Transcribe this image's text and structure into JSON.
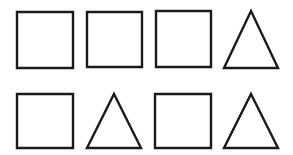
{
  "canvas": {
    "width": 293,
    "height": 155,
    "background_color": "#ffffff",
    "description": "Grid of outlined geometric shapes"
  },
  "style": {
    "stroke_color": "#1a1a1a",
    "fill_color": "none",
    "stroke_width": 2.4
  },
  "grid": {
    "rows": 2,
    "columns": 4,
    "total_shapes": 8
  },
  "shapes": [
    {
      "id": "shape-r1c1",
      "type": "square",
      "row": 1,
      "column": 1,
      "x": 17,
      "y": 12,
      "width": 56,
      "height": 56,
      "points": "17,12 73,12 73,68 17,68"
    },
    {
      "id": "shape-r1c2",
      "type": "square",
      "row": 1,
      "column": 2,
      "x": 87,
      "y": 12,
      "width": 55,
      "height": 55,
      "points": "87,12 142,12 142,67 87,67"
    },
    {
      "id": "shape-r1c3",
      "type": "square",
      "row": 1,
      "column": 3,
      "x": 156,
      "y": 11,
      "width": 55,
      "height": 56,
      "points": "156,11 211,11 211,67 156,67"
    },
    {
      "id": "shape-r1c4",
      "type": "triangle",
      "row": 1,
      "column": 4,
      "x": 224,
      "y": 11,
      "width": 54,
      "height": 57,
      "points": "251,11 278,68 224,68"
    },
    {
      "id": "shape-r2c1",
      "type": "square",
      "row": 2,
      "column": 1,
      "x": 17,
      "y": 94,
      "width": 56,
      "height": 54,
      "points": "17,94 73,94 73,148 17,148"
    },
    {
      "id": "shape-r2c2",
      "type": "triangle",
      "row": 2,
      "column": 2,
      "x": 87,
      "y": 94,
      "width": 54,
      "height": 54,
      "points": "114,94 141,148 87,148"
    },
    {
      "id": "shape-r2c3",
      "type": "square",
      "row": 2,
      "column": 3,
      "x": 155,
      "y": 94,
      "width": 56,
      "height": 54,
      "points": "155,94 211,94 211,148 155,148"
    },
    {
      "id": "shape-r2c4",
      "type": "triangle",
      "row": 2,
      "column": 4,
      "x": 224,
      "y": 94,
      "width": 54,
      "height": 54,
      "points": "251,94 278,148 224,148"
    }
  ]
}
